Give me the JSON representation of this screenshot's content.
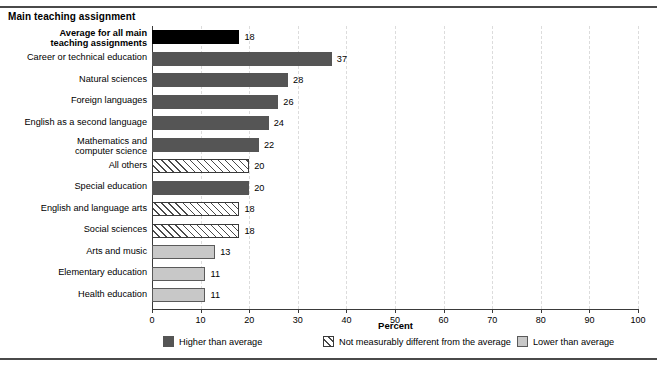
{
  "header": {
    "category_header": "Main teaching assignment"
  },
  "axis": {
    "xlabel": "Percent",
    "ticks": [
      0,
      10,
      20,
      30,
      40,
      50,
      60,
      70,
      80,
      90,
      100
    ]
  },
  "legend": {
    "items": [
      {
        "label": "Higher than average",
        "style": "higher",
        "color": "#555555"
      },
      {
        "label": "Not measurably different from the average",
        "style": "notdiff",
        "color": "#ffffff"
      },
      {
        "label": "Lower than average",
        "style": "lower",
        "color": "#c8c8c8"
      }
    ]
  },
  "chart_data": {
    "type": "bar",
    "orientation": "horizontal",
    "title": "Main teaching assignment",
    "xlabel": "Percent",
    "ylabel": "",
    "xlim": [
      0,
      100
    ],
    "grid": "vertical-dashed",
    "legend_position": "bottom",
    "categories": [
      "Average for all main\nteaching assignments",
      "Career or technical education",
      "Natural sciences",
      "Foreign languages",
      "English as a second language",
      "Mathematics and\ncomputer science",
      "All others",
      "Special education",
      "English and language arts",
      "Social sciences",
      "Arts and music",
      "Elementary education",
      "Health education"
    ],
    "values": [
      18,
      37,
      28,
      26,
      24,
      22,
      20,
      20,
      18,
      18,
      13,
      11,
      11
    ],
    "styles": [
      "average",
      "higher",
      "higher",
      "higher",
      "higher",
      "higher",
      "notdiff",
      "higher",
      "notdiff",
      "notdiff",
      "lower",
      "lower",
      "lower"
    ],
    "bold_labels": [
      true,
      false,
      false,
      false,
      false,
      false,
      false,
      false,
      false,
      false,
      false,
      false,
      false
    ]
  }
}
